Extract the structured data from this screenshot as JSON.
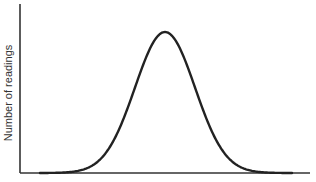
{
  "chart_data": {
    "type": "line",
    "title": "",
    "xlabel": "",
    "ylabel": "Number of readings",
    "grid": false,
    "legend": null,
    "x_ticks": [],
    "y_ticks": [],
    "shape": "normal distribution (bell curve)",
    "x": [
      -3.0,
      -2.5,
      -2.0,
      -1.5,
      -1.0,
      -0.5,
      0.0,
      0.5,
      1.0,
      1.5,
      2.0,
      2.5,
      3.0
    ],
    "y": [
      0.011,
      0.044,
      0.135,
      0.325,
      0.607,
      0.882,
      1.0,
      0.882,
      0.607,
      0.325,
      0.135,
      0.044,
      0.011
    ],
    "xlim": [
      -3.3,
      3.3
    ],
    "ylim": [
      0,
      1.2
    ],
    "line_color": "#222222",
    "axis_color": "#333333"
  }
}
